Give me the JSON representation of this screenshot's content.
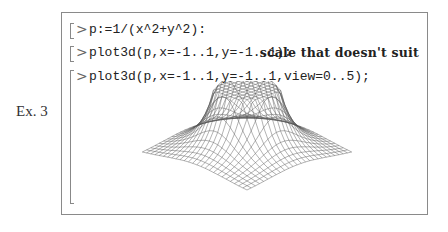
{
  "example_label": "Ex. 3",
  "worksheet": {
    "prompt_symbol": ">",
    "commands": [
      "p:=1/(x^2+y^2):",
      "plot3d(p,x=-1..1,y=-1..1):",
      "plot3d(p,x=-1..1,y=-1..1,view=0..5);"
    ],
    "annotation": "scale that doesn't suit"
  },
  "plot": {
    "type": "3d-wireframe-surface",
    "function": "1/(x^2+y^2)",
    "x_range": [
      -1,
      1
    ],
    "y_range": [
      -1,
      1
    ],
    "view": [
      0,
      5
    ],
    "grid": 25,
    "line_color": "#555555"
  }
}
